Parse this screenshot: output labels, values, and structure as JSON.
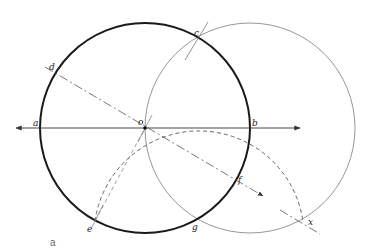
{
  "caption": "a",
  "labels": {
    "a": "a",
    "b": "b",
    "c": "c",
    "d": "d",
    "e": "e",
    "f": "f",
    "g": "g",
    "o": "o",
    "x": "x"
  },
  "colors": {
    "thick_circle": "#1a1a1a",
    "thin_circle": "#8a8a8a",
    "lines": "#444444",
    "dashed": "#555555",
    "background": "#ffffff"
  },
  "geometry": {
    "main_circle": {
      "cx": 145,
      "cy": 128,
      "r": 105
    },
    "second_circle": {
      "cx": 250,
      "cy": 128,
      "r": 105
    },
    "dashed_arc_center": {
      "cx": 197,
      "cy": 219,
      "r": 105
    }
  }
}
